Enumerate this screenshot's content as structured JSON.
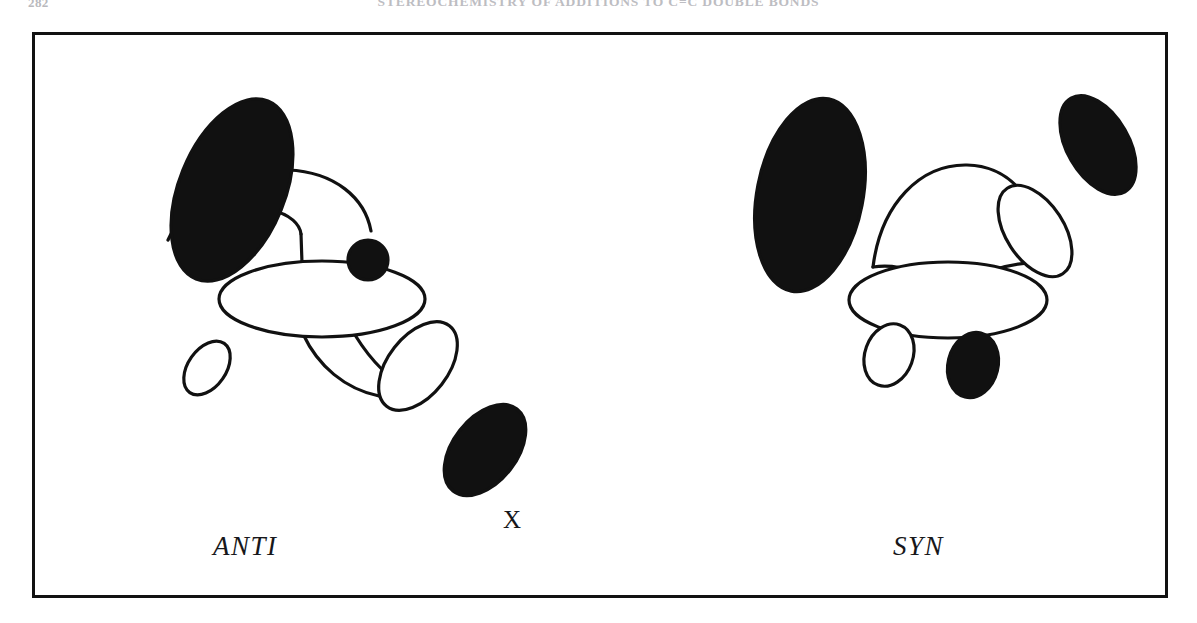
{
  "page": {
    "folio": "282",
    "running_head": "STEREOCHEMISTRY OF ADDITIONS TO C=C DOUBLE BONDS",
    "background_color": "#ffffff",
    "ink_color": "#111111"
  },
  "figure": {
    "frame": {
      "border_color": "#111111",
      "border_width_px": 3,
      "x": 32,
      "y": 32,
      "width": 1136,
      "height": 566
    },
    "structures": [
      {
        "id": "anti",
        "caption": "ANTI",
        "caption_style": "italic",
        "atom_label": "X",
        "description": "Transition state drawn with two p-type orbital lobes anti-periplanar across the central sigma framework",
        "lobes": [
          {
            "name": "upper-left-filled-lobe",
            "fill": "#111111",
            "cx": 197,
            "cy": 155,
            "rx": 53,
            "ry": 96,
            "rotate": 22
          },
          {
            "name": "central-ring-ellipse",
            "fill": "none",
            "cx": 287,
            "cy": 264,
            "rx": 103,
            "ry": 38,
            "rotate": 0
          },
          {
            "name": "small-filled-circle",
            "fill": "#111111",
            "cx": 333,
            "cy": 225,
            "rx": 20,
            "ry": 20,
            "rotate": 0
          },
          {
            "name": "lower-open-lobe",
            "fill": "none",
            "cx": 383,
            "cy": 331,
            "rx": 30,
            "ry": 51,
            "rotate": 38
          },
          {
            "name": "lower-filled-lobe",
            "fill": "#111111",
            "cx": 450,
            "cy": 415,
            "rx": 32,
            "ry": 52,
            "rotate": 38
          },
          {
            "name": "free-open-lobe",
            "fill": "none",
            "cx": 172,
            "cy": 333,
            "rx": 19,
            "ry": 30,
            "rotate": 35
          }
        ]
      },
      {
        "id": "syn",
        "caption": "SYN",
        "caption_style": "italic",
        "description": "Transition state drawn with both p-type orbital lobes syn-periplanar on the same face of the central sigma framework",
        "lobes": [
          {
            "name": "upper-left-filled-lobe",
            "fill": "#111111",
            "cx": 775,
            "cy": 160,
            "rx": 53,
            "ry": 98,
            "rotate": 11
          },
          {
            "name": "central-ring-ellipse",
            "fill": "none",
            "cx": 913,
            "cy": 265,
            "rx": 99,
            "ry": 38,
            "rotate": 0
          },
          {
            "name": "upper-right-open-lobe",
            "fill": "none",
            "cx": 1000,
            "cy": 196,
            "rx": 29,
            "ry": 51,
            "rotate": -33
          },
          {
            "name": "upper-right-filled-lobe",
            "fill": "#111111",
            "cx": 1063,
            "cy": 110,
            "rx": 31,
            "ry": 54,
            "rotate": -30
          },
          {
            "name": "lower-left-open-lobe",
            "fill": "none",
            "cx": 854,
            "cy": 320,
            "rx": 24,
            "ry": 32,
            "rotate": 20
          },
          {
            "name": "lower-right-filled-lobe",
            "fill": "#111111",
            "cx": 938,
            "cy": 330,
            "rx": 25,
            "ry": 33,
            "rotate": 14
          }
        ]
      }
    ]
  }
}
